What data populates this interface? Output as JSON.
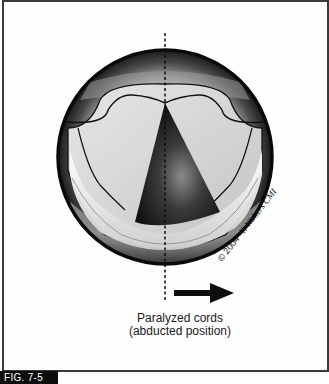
{
  "figure": {
    "label": "FIG. 7-5",
    "caption_line1": "Paralyzed cords",
    "caption_line2": "(abducted position)",
    "copyright": "© 2004",
    "signature": "Y. Walters CMI",
    "arrow_direction": "right",
    "colors": {
      "frame": "#3a3a3a",
      "label_bg": "#0d0d0d",
      "label_text": "#ffffff",
      "outline": "#0a0a0a"
    }
  }
}
